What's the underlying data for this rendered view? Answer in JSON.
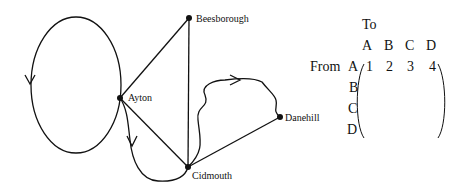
{
  "graph": {
    "nodes": [
      {
        "id": "A",
        "label": "Ayton"
      },
      {
        "id": "B",
        "label": "Beesborough"
      },
      {
        "id": "C",
        "label": "Cidmouth"
      },
      {
        "id": "D",
        "label": "Danehill"
      }
    ]
  },
  "matrix": {
    "to_label": "To",
    "from_label": "From",
    "col_headers": [
      "A",
      "B",
      "C",
      "D"
    ],
    "row_headers": [
      "A",
      "B",
      "C",
      "D"
    ],
    "rows": [
      [
        "1",
        "2",
        "3",
        "4"
      ],
      [
        "",
        "",
        "",
        ""
      ],
      [
        "",
        "",
        "",
        ""
      ],
      [
        "",
        "",
        "",
        ""
      ]
    ]
  }
}
